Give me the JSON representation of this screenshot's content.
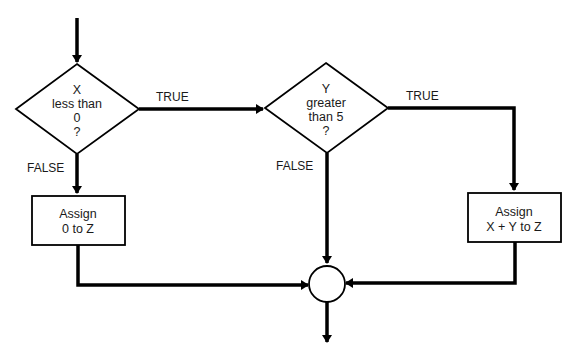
{
  "diagram": {
    "type": "flowchart",
    "nodes": {
      "decision1": {
        "lines": [
          "X",
          "less than",
          "0",
          "?"
        ]
      },
      "decision2": {
        "lines": [
          "Y",
          "greater",
          "than 5",
          "?"
        ]
      },
      "process1": {
        "lines": [
          "Assign",
          "0 to Z"
        ]
      },
      "process2": {
        "lines": [
          "Assign",
          "X + Y to Z"
        ]
      }
    },
    "edge_labels": {
      "d1_true": "TRUE",
      "d1_false": "FALSE",
      "d2_true": "TRUE",
      "d2_false": "FALSE"
    },
    "colors": {
      "stroke": "#000000",
      "background": "#ffffff",
      "text": "#1a1a1a"
    }
  }
}
